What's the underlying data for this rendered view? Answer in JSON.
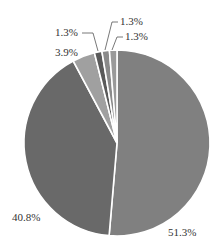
{
  "chart_data": {
    "type": "pie",
    "title": "",
    "categories": [
      "A",
      "B",
      "C",
      "D",
      "E",
      "F"
    ],
    "values": [
      51.3,
      40.8,
      3.9,
      1.3,
      1.3,
      1.3
    ],
    "labels": [
      "51.3%",
      "40.8%",
      "3.9%",
      "1.3%",
      "1.3%",
      "1.3%"
    ],
    "colors": [
      "#808080",
      "#696969",
      "#a0a0a0",
      "#5a5a5a",
      "#8a8a8a",
      "#9a9a9a"
    ],
    "start_angle_deg": 0,
    "direction": "clockwise",
    "legend": "none"
  }
}
